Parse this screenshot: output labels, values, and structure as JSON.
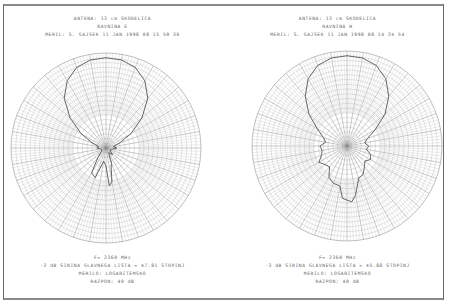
{
  "chart_data": [
    {
      "type": "polar",
      "title": "ANTENA: 13 cm SKODELICA",
      "subtitle": "RAVNINA E",
      "measured_by": "MERIL: S. GAJSEK 11 JAN 1998 08 15 59 36",
      "frequency": "F= 2360 MHz",
      "beamwidth_label": "-3 dB SIRINA GLAVNEGA LISTA = 47.81 STOPINJ",
      "beamwidth_deg": 47.81,
      "scale": "MERILO: LOGARITEMSKO",
      "range": "RAZPON: 40 dB",
      "range_db": 40,
      "grid": {
        "rings": 20,
        "spokes_deg": 10
      },
      "pattern_r_norm": [
        [
          0,
          1.0
        ],
        [
          10,
          0.99
        ],
        [
          20,
          0.95
        ],
        [
          30,
          0.86
        ],
        [
          40,
          0.72
        ],
        [
          50,
          0.52
        ],
        [
          60,
          0.32
        ],
        [
          70,
          0.16
        ],
        [
          80,
          0.08
        ],
        [
          90,
          0.12
        ],
        [
          100,
          0.07
        ],
        [
          110,
          0.06
        ],
        [
          120,
          0.05
        ],
        [
          135,
          0.1
        ],
        [
          150,
          0.06
        ],
        [
          160,
          0.18
        ],
        [
          165,
          0.22
        ],
        [
          170,
          0.38
        ],
        [
          175,
          0.42
        ],
        [
          180,
          0.2
        ],
        [
          190,
          0.15
        ],
        [
          200,
          0.35
        ],
        [
          210,
          0.32
        ],
        [
          220,
          0.14
        ],
        [
          240,
          0.05
        ],
        [
          260,
          0.06
        ],
        [
          270,
          0.1
        ],
        [
          280,
          0.08
        ],
        [
          290,
          0.16
        ],
        [
          300,
          0.32
        ],
        [
          310,
          0.52
        ],
        [
          320,
          0.72
        ],
        [
          330,
          0.86
        ],
        [
          340,
          0.95
        ],
        [
          350,
          0.99
        ],
        [
          360,
          1.0
        ]
      ]
    },
    {
      "type": "polar",
      "title": "ANTENA: 13 cm SKODELICA",
      "subtitle": "RAVNINA H",
      "measured_by": "MERIL: S. GAJSEK 11 JAN 1998 08 14 24 54",
      "frequency": "F= 2360 MHz",
      "beamwidth_label": "-3 dB SIRINA GLAVNEGA LISTA = 45.88 STOPINJ",
      "beamwidth_deg": 45.88,
      "scale": "MERILO: LOGARITEMSKO",
      "range": "RAZPON: 40 dB",
      "range_db": 40,
      "grid": {
        "rings": 20,
        "spokes_deg": 10
      },
      "pattern_r_norm": [
        [
          0,
          1.0
        ],
        [
          10,
          0.99
        ],
        [
          20,
          0.95
        ],
        [
          30,
          0.86
        ],
        [
          40,
          0.72
        ],
        [
          50,
          0.55
        ],
        [
          60,
          0.36
        ],
        [
          70,
          0.24
        ],
        [
          80,
          0.2
        ],
        [
          90,
          0.24
        ],
        [
          100,
          0.22
        ],
        [
          110,
          0.28
        ],
        [
          120,
          0.3
        ],
        [
          130,
          0.26
        ],
        [
          140,
          0.3
        ],
        [
          150,
          0.36
        ],
        [
          160,
          0.38
        ],
        [
          170,
          0.55
        ],
        [
          175,
          0.62
        ],
        [
          180,
          0.6
        ],
        [
          185,
          0.58
        ],
        [
          190,
          0.45
        ],
        [
          200,
          0.44
        ],
        [
          210,
          0.4
        ],
        [
          220,
          0.3
        ],
        [
          230,
          0.32
        ],
        [
          240,
          0.36
        ],
        [
          250,
          0.3
        ],
        [
          260,
          0.28
        ],
        [
          270,
          0.3
        ],
        [
          280,
          0.24
        ],
        [
          290,
          0.28
        ],
        [
          300,
          0.38
        ],
        [
          310,
          0.55
        ],
        [
          320,
          0.72
        ],
        [
          330,
          0.86
        ],
        [
          340,
          0.95
        ],
        [
          350,
          0.99
        ],
        [
          360,
          1.0
        ]
      ]
    }
  ],
  "panels": [
    {
      "title": "ANTENA: 13 cm SKODELICA",
      "plane": "RAVNINA E",
      "meta": "MERIL: S. GAJSEK 11 JAN 1998 08 15 59 36",
      "freq": "F= 2360 MHz",
      "beamwidth": "-3 dB SIRINA GLAVNEGA LISTA = 47.81 STOPINJ",
      "scale": "MERILO: LOGARITEMSKO",
      "range": "RAZPON: 40 dB"
    },
    {
      "title": "ANTENA: 13 cm SKODELICA",
      "plane": "RAVNINA H",
      "meta": "MERIL: S. GAJSEK 11 JAN 1998 08 14 24 54",
      "freq": "F= 2360 MHz",
      "beamwidth": "-3 dB SIRINA GLAVNEGA LISTA = 45.88 STOPINJ",
      "scale": "MERILO: LOGARITEMSKO",
      "range": "RAZPON: 40 dB"
    }
  ],
  "colors": {
    "grid": "#b0b0b0",
    "spoke": "#888888",
    "trace": "#555555",
    "text": "#666666"
  }
}
